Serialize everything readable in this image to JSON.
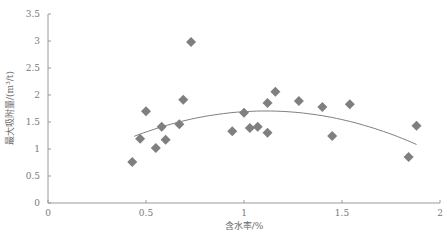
{
  "chart_data": {
    "type": "scatter",
    "title": "",
    "xlabel": "含水率/%",
    "ylabel": "最大吸附量/(m³/t)",
    "xlim": [
      0,
      2
    ],
    "ylim": [
      0,
      3.5
    ],
    "x_ticks": [
      "0",
      "0.5",
      "1",
      "1.5",
      "2"
    ],
    "y_ticks": [
      "0",
      "0.5",
      "1",
      "1.5",
      "2",
      "2.5",
      "3",
      "3.5"
    ],
    "grid": false,
    "legend": null,
    "marker": "diamond",
    "marker_color": "#7f7f7f",
    "series": [
      {
        "name": "points",
        "x": [
          0.43,
          0.47,
          0.5,
          0.55,
          0.58,
          0.6,
          0.67,
          0.69,
          0.73,
          0.94,
          1.0,
          1.03,
          1.07,
          1.12,
          1.12,
          1.16,
          1.28,
          1.4,
          1.45,
          1.54,
          1.84,
          1.88
        ],
        "y": [
          0.76,
          1.19,
          1.7,
          1.02,
          1.41,
          1.17,
          1.46,
          1.91,
          2.98,
          1.33,
          1.67,
          1.39,
          1.41,
          1.3,
          1.85,
          2.06,
          1.89,
          1.78,
          1.24,
          1.83,
          0.85,
          1.43
        ]
      }
    ],
    "trendline": {
      "type": "polynomial",
      "order": 2,
      "color": "#7f7f7f",
      "x": [
        0.44,
        0.6,
        0.8,
        1.0,
        1.2,
        1.4,
        1.6,
        1.88
      ],
      "y": [
        1.22,
        1.43,
        1.62,
        1.72,
        1.7,
        1.59,
        1.42,
        1.11
      ]
    }
  }
}
